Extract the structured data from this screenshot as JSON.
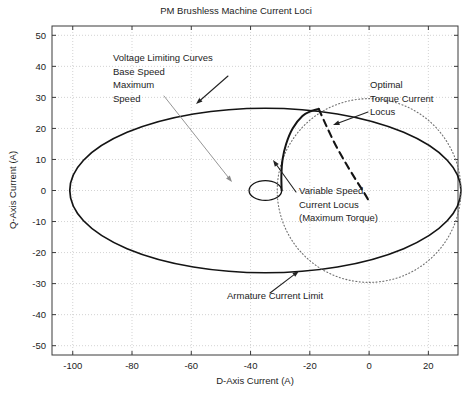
{
  "chart_data": {
    "type": "line",
    "title": "PM Brushless Machine Current Loci",
    "xlabel": "D-Axis Current (A)",
    "ylabel": "Q-Axis Current (A)",
    "xlim": [
      -107,
      30
    ],
    "ylim": [
      -53,
      53
    ],
    "xticks": [
      -100,
      -80,
      -60,
      -40,
      -20,
      0,
      20
    ],
    "xticklabels": [
      "-100",
      "-80",
      "-60",
      "-40",
      "-20",
      "0",
      "20"
    ],
    "yticks": [
      50,
      40,
      30,
      20,
      10,
      0,
      -10,
      -20,
      -30,
      -40,
      -50
    ],
    "yticklabels": [
      "50",
      "40",
      "30",
      "20",
      "10",
      "0",
      "-10",
      "-20",
      "-30",
      "-40",
      "-50"
    ],
    "grid": true,
    "legend": "none",
    "series": [
      {
        "name": "Voltage Limiting Curve - Base Speed",
        "style": "solid",
        "shape": "ellipse",
        "center": [
          -35,
          0
        ],
        "semi_axis_x": 66,
        "semi_axis_y": 26.5,
        "description": "Large solid ellipse, base speed voltage limit locus"
      },
      {
        "name": "Voltage Limiting Curve - Maximum Speed",
        "style": "solid",
        "shape": "ellipse",
        "center": [
          -35,
          0
        ],
        "semi_axis_x": 5.5,
        "semi_axis_y": 3.2,
        "description": "Small solid ellipse, maximum speed voltage limit locus"
      },
      {
        "name": "Armature Current Limit",
        "style": "dotted",
        "shape": "circle",
        "center": [
          0,
          0
        ],
        "radius": 31,
        "description": "Dotted circle of constant armature current magnitude"
      },
      {
        "name": "Variable Speed Current Locus (Maximum Torque)",
        "style": "solid-thick",
        "shape": "open-curve",
        "points": [
          [
            -29.5,
            0
          ],
          [
            -29.6,
            5
          ],
          [
            -29.2,
            10
          ],
          [
            -28.0,
            15
          ],
          [
            -25.8,
            20
          ],
          [
            -22.5,
            24
          ],
          [
            -19.5,
            25.6
          ],
          [
            -17.0,
            26.3
          ]
        ],
        "description": "Solid curve rising from small ellipse to intersection on armature limit"
      },
      {
        "name": "Optimal Torque Current Locus",
        "style": "dashed",
        "shape": "open-curve",
        "points": [
          [
            -17.0,
            26.3
          ],
          [
            -14.5,
            21.0
          ],
          [
            -11.5,
            15.0
          ],
          [
            -8.0,
            9.0
          ],
          [
            -4.5,
            3.5
          ],
          [
            -1.5,
            -1.0
          ],
          [
            0.3,
            -4.0
          ]
        ],
        "description": "Dashed curve from intersection point descending to the right"
      }
    ],
    "annotations": [
      {
        "id": "voltage-limiting-curves",
        "lines": [
          "Voltage Limiting Curves",
          "Base Speed",
          "Maximum",
          "Speed"
        ],
        "text_anchor_px": [
          113,
          61
        ],
        "arrows": [
          {
            "from_px": [
              228,
              76
            ],
            "to_px": [
              196,
              104
            ],
            "style": "solid-dark"
          },
          {
            "from_px": [
              164,
              96
            ],
            "to_px": [
              232,
              182
            ],
            "style": "solid-grey"
          }
        ]
      },
      {
        "id": "optimal-torque-current-locus",
        "lines": [
          "Optimal",
          "Torque Current",
          "Locus"
        ],
        "text_anchor_px": [
          370,
          88
        ],
        "arrows": [
          {
            "from_px": [
              368,
              112
            ],
            "to_px": [
              333,
              125
            ],
            "style": "solid-dark"
          }
        ]
      },
      {
        "id": "variable-speed-current-locus",
        "lines": [
          "Variable Speed",
          "Current Locus",
          "(Maximum Torque)"
        ],
        "text_anchor_px": [
          299,
          194
        ],
        "arrows": [
          {
            "from_px": [
              296,
              192
            ],
            "to_px": [
              273,
              160
            ],
            "style": "solid-dark"
          }
        ]
      },
      {
        "id": "armature-current-limit",
        "lines": [
          "Armature Current Limit"
        ],
        "text_anchor_px": [
          227,
          299
        ],
        "arrows": [
          {
            "from_px": [
              270,
              293
            ],
            "to_px": [
              299,
              271
            ],
            "style": "solid-dark"
          }
        ]
      }
    ],
    "colors": {
      "axis": "#3a3a3a",
      "curve": "#141414",
      "grid": "#c8c8c8",
      "background": "#ffffff",
      "text": "#1d1d1d",
      "leader_grey": "#8a8a8a"
    }
  }
}
